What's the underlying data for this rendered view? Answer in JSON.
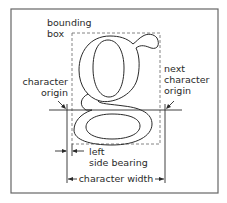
{
  "diagram": {
    "glyph": "g",
    "labels": {
      "bounding_box_line1": "bounding",
      "bounding_box_line2": "box",
      "char_origin_line1": "character",
      "char_origin_line2": "origin",
      "next_origin_line1": "next",
      "next_origin_line2": "character",
      "next_origin_line3": "origin",
      "lsb_line1": "left",
      "lsb_line2": "side bearing",
      "char_width": "character width"
    },
    "colors": {
      "background": "#ffffff",
      "frame": "#666666",
      "lines": "#2a2a2a",
      "dashed_box": "#777777"
    }
  }
}
